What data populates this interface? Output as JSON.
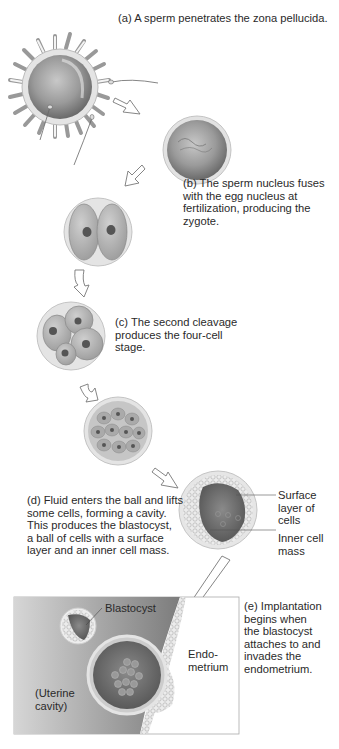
{
  "figure": {
    "stages": [
      {
        "id": "a",
        "caption": [
          "(a) A sperm penetrates the zona pellucida."
        ]
      },
      {
        "id": "b",
        "caption": [
          "(b) The sperm nucleus fuses",
          "with the egg nucleus at",
          "fertilization, producing the",
          "zygote."
        ]
      },
      {
        "id": "c",
        "caption": [
          "(c) The second cleavage",
          "produces the four-cell",
          "stage."
        ]
      },
      {
        "id": "d",
        "caption": [
          "(d) Fluid enters the ball and lifts",
          "some cells, forming a cavity.",
          "This produces the blastocyst,",
          "a ball of cells with a surface",
          "layer and an inner cell mass."
        ]
      },
      {
        "id": "e",
        "caption": [
          "(e) Implantation",
          "begins when",
          "the blastocyst",
          "attaches to and",
          "invades the",
          "endometrium."
        ]
      }
    ],
    "callouts": {
      "surface_layer": [
        "Surface",
        "layer of",
        "cells"
      ],
      "inner_cell_mass": [
        "Inner cell",
        "mass"
      ],
      "blastocyst": "Blastocyst",
      "endometrium": [
        "Endo-",
        "metrium"
      ],
      "uterine_cavity": [
        "(Uterine",
        "cavity)"
      ]
    },
    "colors": {
      "cell_fill": "#9a9a9a",
      "membrane": "#d8d8d8",
      "cavity": "#6e6e6e",
      "uterus_bg": "#8c8c8c",
      "arrow_outline": "#777777"
    }
  }
}
